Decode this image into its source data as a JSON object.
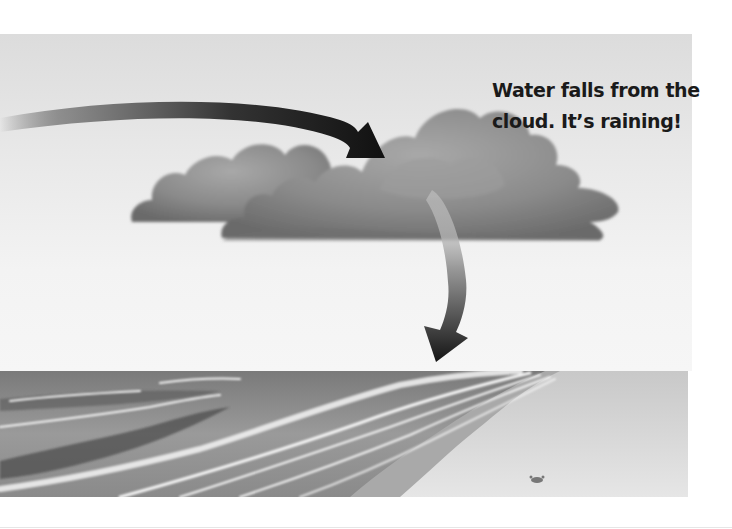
{
  "caption": {
    "line1": "Water falls from the",
    "line2": "cloud. It’s raining!"
  },
  "illustration": {
    "elements": [
      "curved-arrow-into-cloud",
      "rain-cloud",
      "rain-streaks",
      "curved-arrow-down-to-sea",
      "ocean-waves",
      "sandy-beach",
      "crab"
    ],
    "style": "grayscale"
  },
  "colors": {
    "sky_top": "#dcdcdc",
    "sky_bottom": "#f6f6f6",
    "arrow": "#111111",
    "cloud": "#8a8a8a",
    "sand": "#dedede",
    "sea": "#8c8c8c",
    "text": "#1a1a1a"
  }
}
